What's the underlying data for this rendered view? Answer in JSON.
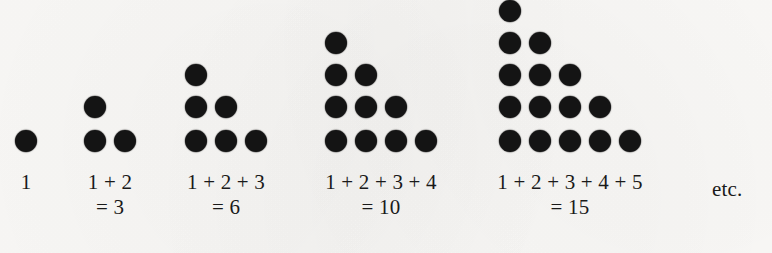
{
  "figure": {
    "background_color": "#fbfaf8",
    "dot_color": "#141414",
    "text_color": "#1a1a1a",
    "trailing_note": "etc."
  },
  "chart_data": {
    "type": "diagram",
    "categories": [
      "1",
      "1 + 2",
      "1 + 2 + 3",
      "1 + 2 + 3 + 4",
      "1 + 2 + 3 + 4 + 5"
    ],
    "values": [
      1,
      3,
      6,
      10,
      15
    ],
    "xlabel": "",
    "ylabel": "",
    "grid": false,
    "legend": "none",
    "note": "etc."
  },
  "groups": [
    {
      "index": 1,
      "rows": 1,
      "dot_count": 1,
      "sum_label": "1",
      "result_label": "",
      "value": 1,
      "row_counts": [
        1
      ]
    },
    {
      "index": 2,
      "rows": 2,
      "dot_count": 3,
      "sum_label": "1 + 2",
      "result_label": "= 3",
      "value": 3,
      "row_counts": [
        1,
        2
      ]
    },
    {
      "index": 3,
      "rows": 3,
      "dot_count": 6,
      "sum_label": "1 + 2 + 3",
      "result_label": "= 6",
      "value": 6,
      "row_counts": [
        1,
        2,
        3
      ]
    },
    {
      "index": 4,
      "rows": 4,
      "dot_count": 10,
      "sum_label": "1 + 2 + 3 + 4",
      "result_label": "= 10",
      "value": 10,
      "row_counts": [
        1,
        2,
        3,
        4
      ]
    },
    {
      "index": 5,
      "rows": 5,
      "dot_count": 15,
      "sum_label": "1 + 2 + 3 + 4 + 5",
      "result_label": "= 15",
      "value": 15,
      "row_counts": [
        1,
        2,
        3,
        4,
        5
      ]
    }
  ],
  "layout": {
    "dot_diameter": 22,
    "col_step": 30,
    "row_step_top": 32,
    "row_step_bottom": 34,
    "baseline_y": 141,
    "group_left_x": [
      15,
      84,
      185,
      325,
      499
    ],
    "caption_top_y": 170,
    "etc": {
      "x": 712,
      "y": 177
    }
  }
}
